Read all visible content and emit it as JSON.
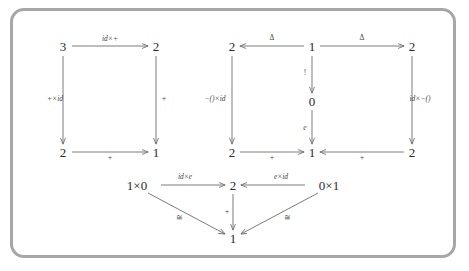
{
  "figure": {
    "border_color": "#a7a7a7",
    "background": "#ffffff",
    "node_color": "#2b2b2b",
    "arrow_color": "#6d6d6d",
    "label_color": "#454545"
  },
  "diagrams": [
    {
      "id": "left-square",
      "name": "associativity-square",
      "nodes": [
        {
          "id": "L-tl",
          "label": "3",
          "x": 63,
          "y": 46
        },
        {
          "id": "L-tr",
          "label": "2",
          "x": 156,
          "y": 46
        },
        {
          "id": "L-bl",
          "label": "2",
          "x": 63,
          "y": 152
        },
        {
          "id": "L-br",
          "label": "1",
          "x": 156,
          "y": 152
        }
      ],
      "arrows": [
        {
          "id": "L-top",
          "label": "id×+",
          "label_x": 110,
          "label_y": 39,
          "label_style": "italic"
        },
        {
          "id": "L-left",
          "label": "+×id",
          "label_x": 55,
          "label_y": 99,
          "label_style": "italic"
        },
        {
          "id": "L-right",
          "label": "+",
          "label_x": 164,
          "label_y": 99,
          "label_style": "plus"
        },
        {
          "id": "L-bottom",
          "label": "+",
          "label_x": 110,
          "label_y": 158,
          "label_style": "plus"
        }
      ]
    },
    {
      "id": "middle-right-squares",
      "name": "unit-squares",
      "nodes": [
        {
          "id": "M-tl",
          "label": "2",
          "x": 232,
          "y": 46
        },
        {
          "id": "M-tc",
          "label": "1",
          "x": 312,
          "y": 46
        },
        {
          "id": "M-tr",
          "label": "2",
          "x": 412,
          "y": 46
        },
        {
          "id": "M-mc",
          "label": "0",
          "x": 312,
          "y": 101
        },
        {
          "id": "M-bl",
          "label": "2",
          "x": 232,
          "y": 152
        },
        {
          "id": "M-bc",
          "label": "1",
          "x": 312,
          "y": 152
        },
        {
          "id": "M-br",
          "label": "2",
          "x": 412,
          "y": 152
        }
      ],
      "arrows": [
        {
          "id": "M-top-left",
          "label": "Δ",
          "label_x": 272,
          "label_y": 38,
          "label_style": "upright"
        },
        {
          "id": "M-top-right",
          "label": "Δ",
          "label_x": 362,
          "label_y": 38,
          "label_style": "upright"
        },
        {
          "id": "M-left",
          "label": "−()×id",
          "label_x": 215,
          "label_y": 99,
          "label_style": "italic"
        },
        {
          "id": "M-right",
          "label": "id×−()",
          "label_x": 420,
          "label_y": 99,
          "label_style": "italic"
        },
        {
          "id": "M-center-up",
          "label": "!",
          "label_x": 305,
          "label_y": 73,
          "label_style": "upright"
        },
        {
          "id": "M-center-dn",
          "label": "e",
          "label_x": 305,
          "label_y": 128,
          "label_style": "italic"
        },
        {
          "id": "M-bot-left",
          "label": "+",
          "label_x": 272,
          "label_y": 158,
          "label_style": "plus"
        },
        {
          "id": "M-bot-right",
          "label": "+",
          "label_x": 362,
          "label_y": 158,
          "label_style": "plus"
        }
      ]
    },
    {
      "id": "bottom-triangle",
      "name": "unit-law-triangles",
      "nodes": [
        {
          "id": "B-l",
          "label": "1×0",
          "x": 137,
          "y": 185
        },
        {
          "id": "B-c",
          "label": "2",
          "x": 233,
          "y": 185
        },
        {
          "id": "B-r",
          "label": "0×1",
          "x": 329,
          "y": 185
        },
        {
          "id": "B-b",
          "label": "1",
          "x": 233,
          "y": 238
        }
      ],
      "arrows": [
        {
          "id": "B-top-left",
          "label": "id×e",
          "label_x": 185,
          "label_y": 177,
          "label_style": "italic"
        },
        {
          "id": "B-top-right",
          "label": "e×id",
          "label_x": 281,
          "label_y": 177,
          "label_style": "italic"
        },
        {
          "id": "B-center",
          "label": "+",
          "label_x": 227,
          "label_y": 212,
          "label_style": "plus"
        },
        {
          "id": "B-diag-left",
          "label": "≅",
          "label_x": 179,
          "label_y": 218,
          "label_style": "iso"
        },
        {
          "id": "B-diag-right",
          "label": "≅",
          "label_x": 287,
          "label_y": 218,
          "label_style": "iso"
        }
      ]
    }
  ]
}
